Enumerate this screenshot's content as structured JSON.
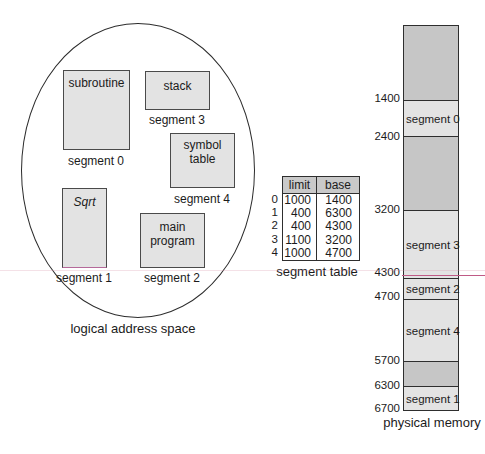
{
  "logical_space": {
    "caption": "logical address space",
    "boxes": [
      {
        "name": "subroutine",
        "segment": "segment 0"
      },
      {
        "name": "stack",
        "segment": "segment 3"
      },
      {
        "name": "symbol table",
        "segment": "segment 4"
      },
      {
        "name": "Sqrt",
        "segment": "segment 1"
      },
      {
        "name": "main program",
        "segment": "segment 2"
      }
    ]
  },
  "segment_table": {
    "caption": "segment table",
    "columns": [
      "limit",
      "base"
    ],
    "rows": [
      {
        "index": "0",
        "limit": "1000",
        "base": "1400"
      },
      {
        "index": "1",
        "limit": "400",
        "base": "6300"
      },
      {
        "index": "2",
        "limit": "400",
        "base": "4300"
      },
      {
        "index": "3",
        "limit": "1100",
        "base": "3200"
      },
      {
        "index": "4",
        "limit": "1000",
        "base": "4700"
      }
    ]
  },
  "physical_memory": {
    "caption": "physical memory",
    "addresses": [
      "1400",
      "2400",
      "3200",
      "4300",
      "4700",
      "5700",
      "6300",
      "6700"
    ],
    "segments": [
      "segment 0",
      "segment 3",
      "segment 2",
      "segment 4",
      "segment 1"
    ]
  },
  "colors": {
    "segment_fill": "#e3e3e3",
    "free_fill": "#c6c6c6",
    "table_header_fill": "#c9c9c9",
    "artifact_pink": "#c05a86"
  }
}
